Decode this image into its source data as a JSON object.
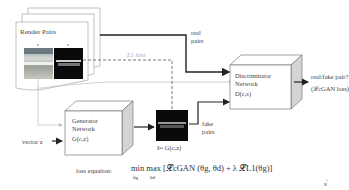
{
  "render_pairs": {
    "title": "Render Pairs",
    "c_label": "c",
    "s_label": "s"
  },
  "edges": {
    "real_pairs": [
      "real",
      "pairs"
    ],
    "fake_pairs": [
      "fake",
      "pairs"
    ],
    "l1_loss": "L1 loss",
    "vector_z": "vector z"
  },
  "discriminator": {
    "line1": "Discriminator",
    "line2": "Network",
    "line3": "D(c,s)"
  },
  "generator": {
    "line1": "Generator",
    "line2": "Network",
    "line3": "G(c,z)"
  },
  "output": {
    "question": "real/fake pair?",
    "loss": "(𝓛cGAN loss)"
  },
  "generated_label": "ŝ= G(c,z)",
  "loss_equation": {
    "label": "loss equation:",
    "formula": "min max [𝓛cGAN (θg, θd) + λ 𝓛L1(θg)]",
    "min_sub": "θg",
    "max_sub": "θd"
  },
  "page_number": "6"
}
